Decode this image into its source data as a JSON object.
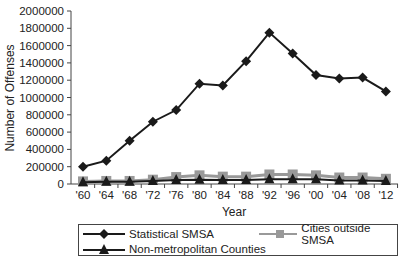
{
  "chart_data": {
    "type": "line",
    "title": "",
    "xlabel": "Year",
    "ylabel": "Number of Offenses",
    "ylim": [
      0,
      2000000
    ],
    "yticks": [
      0,
      200000,
      400000,
      600000,
      800000,
      1000000,
      1200000,
      1400000,
      1600000,
      1800000,
      2000000
    ],
    "grid": false,
    "legend_position": "bottom",
    "categories": [
      "'60",
      "'64",
      "'68",
      "'72",
      "'76",
      "'80",
      "'84",
      "'88",
      "'92",
      "'96",
      "'00",
      "'04",
      "'08",
      "'12"
    ],
    "series": [
      {
        "name": "Statistical SMSA",
        "marker": "diamond",
        "color": "#1a1a1a",
        "values": [
          200000,
          270000,
          500000,
          720000,
          855000,
          1160000,
          1140000,
          1420000,
          1750000,
          1510000,
          1260000,
          1220000,
          1230000,
          1070000
        ]
      },
      {
        "name": "Cities outside SMSA",
        "marker": "square",
        "color": "#999999",
        "values": [
          30000,
          35000,
          35000,
          50000,
          80000,
          100000,
          85000,
          85000,
          110000,
          110000,
          100000,
          75000,
          75000,
          60000
        ]
      },
      {
        "name": "Non-metropolitan Counties",
        "marker": "triangle",
        "color": "#1a1a1a",
        "values": [
          20000,
          25000,
          25000,
          35000,
          45000,
          50000,
          45000,
          45000,
          55000,
          55000,
          55000,
          40000,
          40000,
          35000
        ]
      }
    ]
  },
  "legend": {
    "items": [
      {
        "label": "Statistical SMSA"
      },
      {
        "label": "Cities outside SMSA"
      },
      {
        "label": "Non-metropolitan Counties"
      }
    ]
  }
}
